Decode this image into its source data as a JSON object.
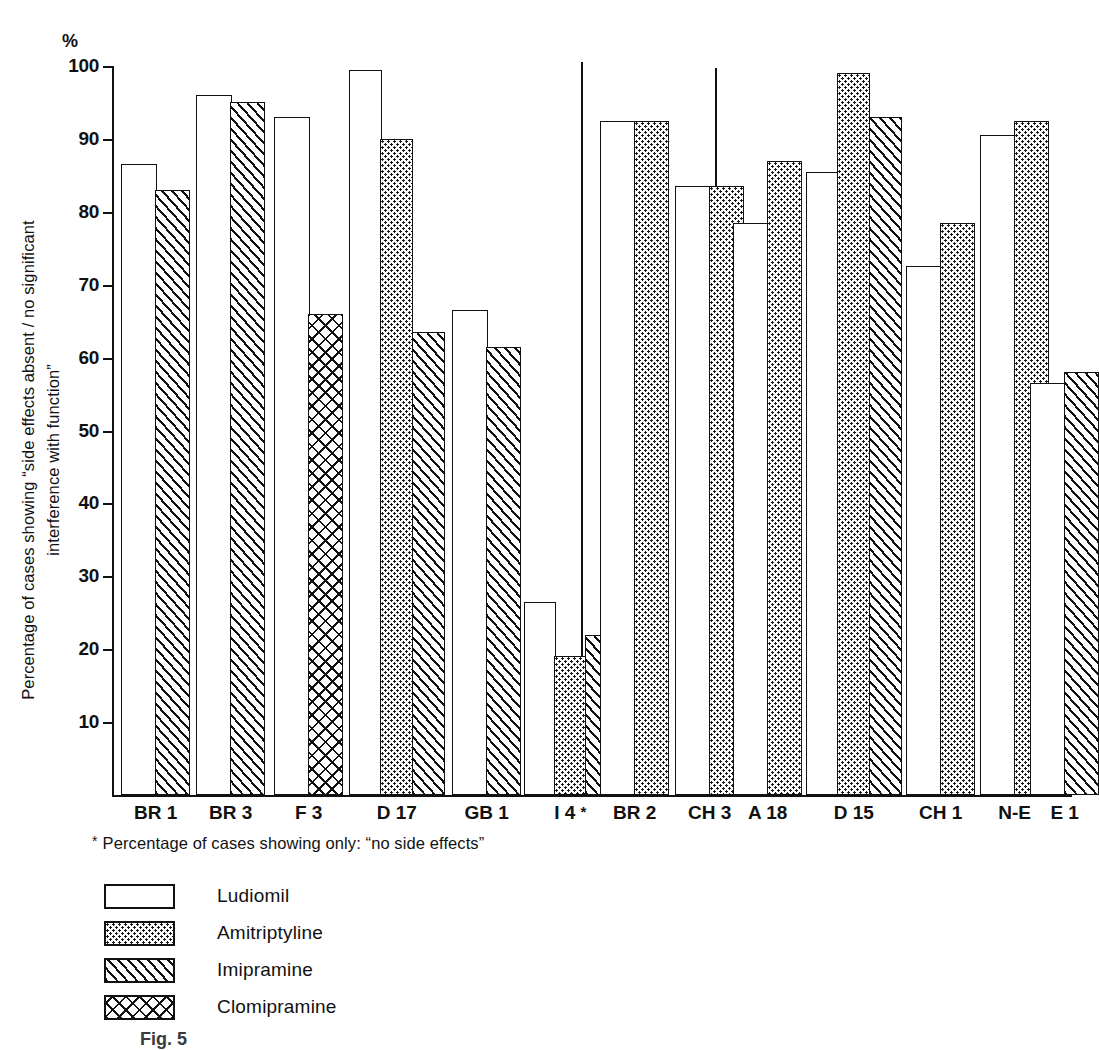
{
  "chart_data": {
    "type": "bar",
    "title": "",
    "unit_label": "%",
    "ylabel": "Percentage of cases showing “side effects absent / no significant\ninterference with function”",
    "xlabel": "",
    "ylim": [
      0,
      100
    ],
    "ytick_values": [
      10,
      20,
      30,
      40,
      50,
      60,
      70,
      80,
      90,
      100
    ],
    "ytick_labels": [
      "10",
      "20",
      "30",
      "40",
      "50",
      "60",
      "70",
      "80",
      "90",
      "100"
    ],
    "grid": false,
    "legend_position": "below-left",
    "footnote": "Percentage of cases showing only: “no side effects”",
    "footnote_marker": "*",
    "categories": [
      "BR 1",
      "BR 3",
      "F 3",
      "D 17",
      "GB 1",
      "I 4 *",
      "BR 2",
      "CH 3",
      "A 18",
      "D 15",
      "CH 1",
      "N-E",
      "E 1"
    ],
    "series": [
      {
        "name": "Ludiomil",
        "pattern": "plain",
        "values": [
          86.5,
          96.0,
          93.0,
          99.5,
          66.5,
          26.5,
          92.5,
          83.5,
          78.5,
          85.5,
          72.5,
          90.5,
          56.5
        ]
      },
      {
        "name": "Amitriptyline",
        "pattern": "dots",
        "values": [
          null,
          null,
          null,
          90.0,
          null,
          19.0,
          92.5,
          83.5,
          87.0,
          99.0,
          78.5,
          92.5,
          null
        ]
      },
      {
        "name": "Imipramine",
        "pattern": "diag",
        "values": [
          83.0,
          95.0,
          null,
          63.5,
          61.5,
          22.0,
          null,
          null,
          null,
          93.0,
          null,
          null,
          58.0
        ]
      },
      {
        "name": "Clomipramine",
        "pattern": "cross",
        "values": [
          null,
          null,
          66.0,
          null,
          null,
          null,
          null,
          null,
          null,
          null,
          null,
          null,
          null
        ]
      }
    ],
    "group_separators_after": [
      "I 4 *",
      "CH 3"
    ],
    "colors": {
      "ink": "#111111",
      "paper": "#ffffff"
    }
  },
  "legend": {
    "items": [
      {
        "label": "Ludiomil",
        "pattern": "plain"
      },
      {
        "label": "Amitriptyline",
        "pattern": "dots"
      },
      {
        "label": "Imipramine",
        "pattern": "diag"
      },
      {
        "label": "Clomipramine",
        "pattern": "cross"
      }
    ]
  },
  "caption": "Fig. 5"
}
